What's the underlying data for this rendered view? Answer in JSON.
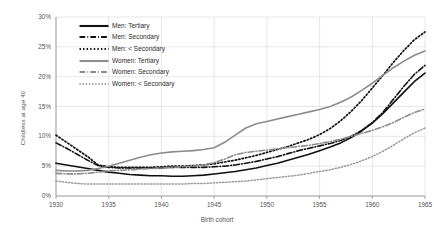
{
  "chart_data": {
    "type": "line",
    "title": "",
    "xlabel": "Birth cohort",
    "ylabel": "Childless at age 40",
    "xlim": [
      1930,
      1965
    ],
    "ylim": [
      0,
      30
    ],
    "grid": true,
    "legend_position": "upper-left-inside",
    "xticks": [
      "1930",
      "1935",
      "1940",
      "1945",
      "1950",
      "1955",
      "1960",
      "1965"
    ],
    "xtick_values": [
      1930,
      1935,
      1940,
      1945,
      1950,
      1955,
      1960,
      1965
    ],
    "yticks": [
      "0%",
      "5%",
      "10%",
      "15%",
      "20%",
      "25%",
      "30%"
    ],
    "ytick_values": [
      0,
      5,
      10,
      15,
      20,
      25,
      30
    ],
    "x": [
      1930,
      1931,
      1932,
      1933,
      1934,
      1935,
      1936,
      1937,
      1938,
      1939,
      1940,
      1941,
      1942,
      1943,
      1944,
      1945,
      1946,
      1947,
      1948,
      1949,
      1950,
      1951,
      1952,
      1953,
      1954,
      1955,
      1956,
      1957,
      1958,
      1959,
      1960,
      1961,
      1962,
      1963,
      1964,
      1965
    ],
    "series": [
      {
        "name": "Men: Tertiary",
        "color": "#111111",
        "style": "solid",
        "width": 1.6,
        "values": [
          5.5,
          5.2,
          4.9,
          4.6,
          4.3,
          4.0,
          3.8,
          3.6,
          3.5,
          3.4,
          3.4,
          3.3,
          3.3,
          3.4,
          3.5,
          3.7,
          3.9,
          4.1,
          4.4,
          4.7,
          5.1,
          5.5,
          6.0,
          6.5,
          7.0,
          7.6,
          8.2,
          8.9,
          9.8,
          10.9,
          12.2,
          13.8,
          15.6,
          17.4,
          19.2,
          20.6
        ]
      },
      {
        "name": "Men: Secondary",
        "color": "#111111",
        "style": "dashdot",
        "width": 1.6,
        "values": [
          8.9,
          8.0,
          7.0,
          6.0,
          5.1,
          4.8,
          4.7,
          4.7,
          4.7,
          4.7,
          4.7,
          4.8,
          4.8,
          4.8,
          4.8,
          4.9,
          5.0,
          5.2,
          5.5,
          5.8,
          6.2,
          6.6,
          7.1,
          7.6,
          8.0,
          8.4,
          8.8,
          9.3,
          10.0,
          11.0,
          12.3,
          14.0,
          16.2,
          18.4,
          20.4,
          21.9
        ]
      },
      {
        "name": "Men: < Secondary",
        "color": "#111111",
        "style": "dotted",
        "width": 1.7,
        "values": [
          10.2,
          9.0,
          7.8,
          6.6,
          5.2,
          4.9,
          4.8,
          4.8,
          4.8,
          4.8,
          4.9,
          5.0,
          5.0,
          5.1,
          5.2,
          5.4,
          5.7,
          6.0,
          6.4,
          6.8,
          7.3,
          7.8,
          8.3,
          8.9,
          9.5,
          10.3,
          11.3,
          12.6,
          14.2,
          16.0,
          18.1,
          20.2,
          22.4,
          24.4,
          26.2,
          27.5
        ]
      },
      {
        "name": "Women: Tertiary",
        "color": "#8c8c8c",
        "style": "solid",
        "width": 1.6,
        "values": [
          4.3,
          4.2,
          4.2,
          4.3,
          4.6,
          5.0,
          5.5,
          6.0,
          6.5,
          6.9,
          7.2,
          7.4,
          7.5,
          7.6,
          7.8,
          8.1,
          9.0,
          10.2,
          11.4,
          12.1,
          12.5,
          12.9,
          13.3,
          13.7,
          14.1,
          14.5,
          15.0,
          15.7,
          16.6,
          17.7,
          18.9,
          20.2,
          21.5,
          22.6,
          23.6,
          24.3
        ]
      },
      {
        "name": "Women: Secondary",
        "color": "#8c8c8c",
        "style": "dashdot",
        "width": 1.6,
        "values": [
          3.8,
          3.7,
          3.7,
          3.8,
          4.0,
          4.2,
          4.3,
          4.4,
          4.5,
          4.6,
          4.7,
          4.8,
          4.9,
          5.0,
          5.2,
          5.6,
          6.2,
          6.9,
          7.3,
          7.5,
          7.7,
          7.9,
          8.1,
          8.3,
          8.5,
          8.8,
          9.1,
          9.5,
          10.0,
          10.5,
          11.0,
          11.6,
          12.3,
          13.2,
          14.0,
          14.6
        ]
      },
      {
        "name": "Women: < Secondary",
        "color": "#9a9a9a",
        "style": "dotted",
        "width": 1.5,
        "values": [
          2.5,
          2.3,
          2.1,
          2.0,
          2.0,
          2.0,
          2.0,
          2.0,
          2.0,
          2.0,
          2.0,
          2.0,
          2.0,
          2.1,
          2.1,
          2.2,
          2.3,
          2.4,
          2.5,
          2.7,
          2.9,
          3.1,
          3.3,
          3.5,
          3.8,
          4.1,
          4.4,
          4.8,
          5.3,
          5.9,
          6.6,
          7.5,
          8.5,
          9.6,
          10.6,
          11.4
        ]
      }
    ]
  }
}
